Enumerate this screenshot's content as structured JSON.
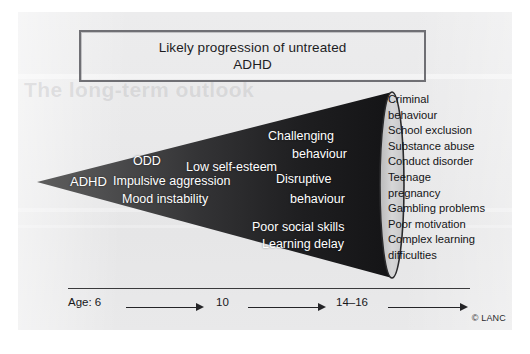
{
  "figure": {
    "title_line1": "Likely progression of untreated",
    "title_line2": "ADHD",
    "bleed_text": "The long-term outlook",
    "copyright": "© LANC"
  },
  "cone_labels": [
    {
      "text": "ADHD",
      "x": 70,
      "y": 174,
      "size": 13
    },
    {
      "text": "ODD",
      "x": 133,
      "y": 154,
      "size": 12.5
    },
    {
      "text": "Impulsive aggression",
      "x": 113,
      "y": 174,
      "size": 12.5
    },
    {
      "text": "Mood instability",
      "x": 122,
      "y": 192,
      "size": 12.5
    },
    {
      "text": "Low self-esteem",
      "x": 186,
      "y": 160,
      "size": 12.5
    },
    {
      "text": "Challenging",
      "x": 268,
      "y": 129,
      "size": 12.5
    },
    {
      "text": "behaviour",
      "x": 292,
      "y": 147,
      "size": 12.5
    },
    {
      "text": "Disruptive",
      "x": 276,
      "y": 172,
      "size": 12.5
    },
    {
      "text": "behaviour",
      "x": 290,
      "y": 192,
      "size": 12.5
    },
    {
      "text": "Poor social skills",
      "x": 252,
      "y": 220,
      "size": 12.5
    },
    {
      "text": "Learning delay",
      "x": 262,
      "y": 237,
      "size": 12.5
    }
  ],
  "outcomes": [
    "Criminal",
    "behaviour",
    "School exclusion",
    "Substance abuse",
    "Conduct disorder",
    "Teenage",
    "pregnancy",
    "Gambling problems",
    "Poor motivation",
    "Complex learning",
    "difficulties"
  ],
  "axis": {
    "label_prefix": "Age: 6",
    "mid_label": "10",
    "end_label": "14–16",
    "marks": [
      {
        "label": "Age: 6",
        "x": 0
      },
      {
        "label": "10",
        "x": 148
      },
      {
        "label": "14–16",
        "x": 268
      }
    ],
    "arrows": [
      {
        "x": 58,
        "w": 78
      },
      {
        "x": 180,
        "w": 78
      },
      {
        "x": 320,
        "w": 80
      }
    ]
  },
  "colors": {
    "paper": "#e9e9ea",
    "cone_light": "#565656",
    "cone_dark": "#151517",
    "title_border": "#6f6f74",
    "text": "#17171a",
    "cone_text": "#ffffff",
    "ellipse_fill": "#cfcfd0",
    "ellipse_stroke": "#2b2b2d"
  },
  "chart_data": {
    "type": "diagram",
    "title": "Likely progression of untreated ADHD",
    "shape": "widening cone / funnel",
    "stages": [
      {
        "age": "6",
        "labels": [
          "ADHD"
        ]
      },
      {
        "age": "6-10",
        "labels": [
          "ODD",
          "Impulsive aggression",
          "Mood instability"
        ]
      },
      {
        "age": "10",
        "labels": [
          "Low self-esteem"
        ]
      },
      {
        "age": "10-14",
        "labels": [
          "Challenging behaviour",
          "Disruptive behaviour",
          "Poor social skills",
          "Learning delay"
        ]
      },
      {
        "age": "14-16",
        "labels": [
          "Criminal behaviour",
          "School exclusion",
          "Substance abuse",
          "Conduct disorder",
          "Teenage pregnancy",
          "Gambling problems",
          "Poor motivation",
          "Complex learning difficulties"
        ]
      }
    ],
    "xlabel": "Age",
    "x_ticks": [
      "6",
      "10",
      "14–16"
    ]
  }
}
